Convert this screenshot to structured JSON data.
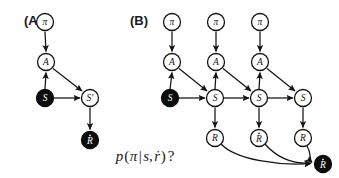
{
  "figure": {
    "width": 339,
    "height": 178,
    "background_color": "#ffffff",
    "ink_color": "#141414",
    "filled_node_color": "#0d0d0d",
    "open_node_color": "#ffffff"
  },
  "panels": [
    {
      "id": "panel-a",
      "label": "(A)",
      "label_x": 24,
      "label_y": 20,
      "caption": "single-step graphical model",
      "nodes": [
        {
          "id": "a-pi",
          "symbol": "π",
          "accent": "",
          "observed": false,
          "x": 45,
          "y": 22,
          "r": 8.5
        },
        {
          "id": "a-action",
          "symbol": "A",
          "accent": "",
          "observed": false,
          "x": 46,
          "y": 62,
          "r": 8.5
        },
        {
          "id": "a-state",
          "symbol": "S",
          "accent": "",
          "observed": true,
          "x": 45,
          "y": 98,
          "r": 8.5
        },
        {
          "id": "a-state-next",
          "symbol": "S′",
          "accent": "",
          "observed": false,
          "x": 90,
          "y": 98,
          "r": 8.5
        },
        {
          "id": "a-reward",
          "symbol": "R",
          "accent": "dot",
          "observed": true,
          "x": 90,
          "y": 140,
          "r": 8.5
        }
      ],
      "edges": [
        {
          "from": "a-pi",
          "to": "a-action"
        },
        {
          "from": "a-state",
          "to": "a-action"
        },
        {
          "from": "a-action",
          "to": "a-state-next"
        },
        {
          "from": "a-state",
          "to": "a-state-next"
        },
        {
          "from": "a-state-next",
          "to": "a-reward"
        }
      ]
    },
    {
      "id": "panel-b",
      "label": "(B)",
      "label_x": 130,
      "label_y": 20,
      "caption": "unrolled multi-step graphical model",
      "nodes": [
        {
          "id": "b-pi-1",
          "symbol": "π",
          "accent": "",
          "observed": false,
          "x": 172,
          "y": 22,
          "r": 8.5
        },
        {
          "id": "b-pi-2",
          "symbol": "π",
          "accent": "",
          "observed": false,
          "x": 216,
          "y": 22,
          "r": 8.5
        },
        {
          "id": "b-pi-3",
          "symbol": "π",
          "accent": "",
          "observed": false,
          "x": 260,
          "y": 22,
          "r": 8.5
        },
        {
          "id": "b-a-1",
          "symbol": "A",
          "accent": "",
          "observed": false,
          "x": 172,
          "y": 62,
          "r": 8.5
        },
        {
          "id": "b-a-2",
          "symbol": "A",
          "accent": "",
          "observed": false,
          "x": 216,
          "y": 62,
          "r": 8.5
        },
        {
          "id": "b-a-3",
          "symbol": "A",
          "accent": "",
          "observed": false,
          "x": 260,
          "y": 62,
          "r": 8.5
        },
        {
          "id": "b-s-0",
          "symbol": "S",
          "accent": "",
          "observed": true,
          "x": 170,
          "y": 98,
          "r": 8.5
        },
        {
          "id": "b-s-1",
          "symbol": "S",
          "accent": "",
          "observed": false,
          "x": 215,
          "y": 98,
          "r": 8.5
        },
        {
          "id": "b-s-2",
          "symbol": "S",
          "accent": "",
          "observed": false,
          "x": 259,
          "y": 98,
          "r": 8.5
        },
        {
          "id": "b-s-3",
          "symbol": "S",
          "accent": "",
          "observed": false,
          "x": 303,
          "y": 98,
          "r": 8.5
        },
        {
          "id": "b-r-1",
          "symbol": "R",
          "accent": "",
          "observed": false,
          "x": 215,
          "y": 138,
          "r": 8.5
        },
        {
          "id": "b-r-2",
          "symbol": "R",
          "accent": "dot",
          "observed": false,
          "x": 259,
          "y": 138,
          "r": 8.5
        },
        {
          "id": "b-r-3",
          "symbol": "R",
          "accent": "",
          "observed": false,
          "x": 303,
          "y": 138,
          "r": 8.5
        },
        {
          "id": "b-r-obs",
          "symbol": "R",
          "accent": "dot",
          "observed": true,
          "x": 323,
          "y": 164,
          "r": 8.5
        }
      ],
      "edges": [
        {
          "from": "b-pi-1",
          "to": "b-a-1"
        },
        {
          "from": "b-pi-2",
          "to": "b-a-2"
        },
        {
          "from": "b-pi-3",
          "to": "b-a-3"
        },
        {
          "from": "b-s-0",
          "to": "b-a-1"
        },
        {
          "from": "b-s-1",
          "to": "b-a-2"
        },
        {
          "from": "b-s-2",
          "to": "b-a-3"
        },
        {
          "from": "b-a-1",
          "to": "b-s-1"
        },
        {
          "from": "b-a-2",
          "to": "b-s-2"
        },
        {
          "from": "b-a-3",
          "to": "b-s-3"
        },
        {
          "from": "b-s-0",
          "to": "b-s-1"
        },
        {
          "from": "b-s-1",
          "to": "b-s-2"
        },
        {
          "from": "b-s-2",
          "to": "b-s-3"
        },
        {
          "from": "b-s-1",
          "to": "b-r-1"
        },
        {
          "from": "b-s-2",
          "to": "b-r-2"
        },
        {
          "from": "b-s-3",
          "to": "b-r-3"
        }
      ],
      "curved_edges": [
        {
          "from": "b-r-1",
          "to": "b-r-obs"
        },
        {
          "from": "b-r-2",
          "to": "b-r-obs"
        },
        {
          "from": "b-r-3",
          "to": "b-r-obs"
        }
      ]
    }
  ],
  "formula": {
    "id": "query-formula",
    "text": "p(π|s,ṙ)?",
    "parts": {
      "p": "p",
      "open_paren": "(",
      "pi": "π",
      "bar": "|",
      "s": "s",
      "comma": ",",
      "r_dot": "ṙ",
      "close_paren": ")",
      "question": "?"
    },
    "x": 145,
    "y": 155
  }
}
